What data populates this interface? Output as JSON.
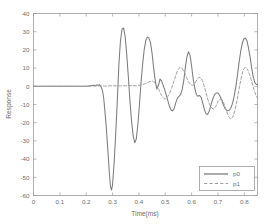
{
  "chart_data": {
    "type": "line",
    "title": "",
    "xlabel": "Time(ms)",
    "ylabel": "Response",
    "xlim": [
      0,
      0.85
    ],
    "ylim": [
      -60,
      40
    ],
    "grid": false,
    "legend_position": "lower-right",
    "xticks": [
      "0",
      "0.1",
      "0.2",
      "0.3",
      "0.4",
      "0.5",
      "0.6",
      "0.7",
      "0.8"
    ],
    "xtick_values": [
      0,
      0.1,
      0.2,
      0.3,
      0.4,
      0.5,
      0.6,
      0.7,
      0.8
    ],
    "yticks": [
      "40",
      "30",
      "20",
      "10",
      "0",
      "-10",
      "-20",
      "-30",
      "-40",
      "-50",
      "-60"
    ],
    "ytick_values": [
      40,
      30,
      20,
      10,
      0,
      -10,
      -20,
      -30,
      -40,
      -50,
      -60
    ],
    "series": [
      {
        "name": "p0",
        "style": "solid",
        "color": "#7c7c7c",
        "x": [
          0.0,
          0.02,
          0.04,
          0.06,
          0.08,
          0.1,
          0.12,
          0.14,
          0.16,
          0.18,
          0.2,
          0.21,
          0.22,
          0.228,
          0.234,
          0.24,
          0.246,
          0.25,
          0.254,
          0.258,
          0.262,
          0.266,
          0.27,
          0.276,
          0.282,
          0.288,
          0.292,
          0.296,
          0.3,
          0.306,
          0.312,
          0.318,
          0.324,
          0.33,
          0.336,
          0.342,
          0.348,
          0.354,
          0.36,
          0.366,
          0.372,
          0.378,
          0.384,
          0.39,
          0.396,
          0.402,
          0.408,
          0.414,
          0.42,
          0.426,
          0.432,
          0.438,
          0.444,
          0.45,
          0.456,
          0.462,
          0.468,
          0.474,
          0.48,
          0.486,
          0.492,
          0.498,
          0.504,
          0.51,
          0.516,
          0.522,
          0.528,
          0.534,
          0.54,
          0.546,
          0.552,
          0.558,
          0.564,
          0.57,
          0.576,
          0.582,
          0.588,
          0.594,
          0.6,
          0.606,
          0.612,
          0.618,
          0.624,
          0.63,
          0.636,
          0.642,
          0.648,
          0.654,
          0.66,
          0.666,
          0.672,
          0.678,
          0.684,
          0.69,
          0.696,
          0.702,
          0.708,
          0.714,
          0.72,
          0.726,
          0.732,
          0.738,
          0.744,
          0.75,
          0.756,
          0.762,
          0.768,
          0.774,
          0.78,
          0.786,
          0.792,
          0.798,
          0.804,
          0.81,
          0.816,
          0.822,
          0.828,
          0.834,
          0.84,
          0.846,
          0.85
        ],
        "values": [
          0.0,
          0.0,
          0.0,
          0.0,
          0.0,
          0.0,
          0.0,
          0.0,
          0.0,
          0.0,
          0.0,
          0.2,
          0.4,
          0.6,
          0.3,
          0.8,
          0.5,
          0.9,
          0.2,
          -0.8,
          -2.5,
          -6.0,
          -12.0,
          -22.0,
          -35.0,
          -48.0,
          -55.0,
          -57.0,
          -54.0,
          -42.0,
          -26.0,
          -8.0,
          12.0,
          25.0,
          31.5,
          32.0,
          27.0,
          17.0,
          5.0,
          -8.0,
          -19.0,
          -27.0,
          -31.0,
          -29.0,
          -21.0,
          -10.0,
          2.0,
          12.0,
          20.0,
          25.0,
          27.0,
          26.5,
          24.0,
          18.0,
          10.0,
          3.0,
          -1.5,
          0.5,
          4.0,
          3.0,
          0.5,
          -2.0,
          -5.0,
          -8.0,
          -11.0,
          -13.0,
          -13.5,
          -12.0,
          -9.0,
          -6.5,
          -5.5,
          -4.5,
          -2.0,
          3.0,
          10.0,
          16.0,
          19.0,
          17.0,
          11.0,
          4.0,
          -1.0,
          -4.5,
          -5.5,
          -5.0,
          -6.0,
          -9.0,
          -12.5,
          -15.0,
          -15.5,
          -14.0,
          -11.0,
          -8.0,
          -5.5,
          -4.0,
          -3.5,
          -4.0,
          -5.5,
          -7.5,
          -10.0,
          -12.0,
          -13.0,
          -13.5,
          -13.0,
          -11.5,
          -9.0,
          -5.0,
          0.0,
          6.0,
          13.0,
          19.0,
          23.5,
          26.0,
          26.5,
          25.0,
          21.0,
          16.0,
          10.0,
          5.0,
          2.0,
          1.0,
          1.0
        ]
      },
      {
        "name": "p1",
        "style": "dashed",
        "color": "#9d9d9d",
        "x": [
          0.0,
          0.05,
          0.1,
          0.15,
          0.2,
          0.24,
          0.27,
          0.3,
          0.33,
          0.36,
          0.39,
          0.41,
          0.425,
          0.44,
          0.45,
          0.46,
          0.47,
          0.478,
          0.486,
          0.494,
          0.5,
          0.508,
          0.516,
          0.524,
          0.532,
          0.54,
          0.548,
          0.556,
          0.564,
          0.572,
          0.58,
          0.588,
          0.596,
          0.604,
          0.612,
          0.62,
          0.628,
          0.636,
          0.644,
          0.652,
          0.66,
          0.668,
          0.676,
          0.684,
          0.692,
          0.7,
          0.708,
          0.716,
          0.724,
          0.732,
          0.74,
          0.748,
          0.756,
          0.764,
          0.772,
          0.78,
          0.788,
          0.796,
          0.804,
          0.812,
          0.82,
          0.828,
          0.836,
          0.844,
          0.85
        ],
        "values": [
          0.0,
          0.0,
          0.0,
          0.0,
          0.0,
          0.2,
          0.1,
          0.3,
          0.2,
          0.4,
          0.3,
          0.8,
          1.5,
          2.5,
          3.0,
          2.0,
          0.0,
          -2.5,
          -5.0,
          -6.5,
          -7.0,
          -6.0,
          -4.0,
          -1.0,
          2.5,
          6.0,
          9.0,
          10.5,
          10.0,
          8.0,
          5.0,
          2.5,
          1.0,
          0.5,
          1.5,
          3.5,
          5.0,
          4.5,
          2.0,
          -2.0,
          -6.5,
          -10.0,
          -12.0,
          -12.5,
          -11.0,
          -8.5,
          -7.0,
          -7.5,
          -10.0,
          -13.5,
          -16.5,
          -18.0,
          -17.0,
          -13.5,
          -8.0,
          -1.5,
          4.5,
          9.0,
          10.5,
          9.5,
          6.5,
          2.5,
          -1.5,
          -5.0,
          -6.5
        ]
      }
    ]
  },
  "legend": {
    "entries": [
      {
        "label": "p0"
      },
      {
        "label": "p1"
      }
    ]
  }
}
